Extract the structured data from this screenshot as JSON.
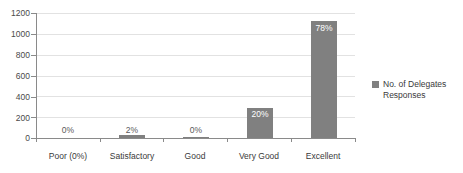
{
  "chart_data": {
    "type": "bar",
    "title": "",
    "xlabel": "",
    "ylabel": "",
    "ylim": [
      0,
      1200
    ],
    "ytick_step": 200,
    "yticks": [
      1200,
      1000,
      800,
      600,
      400,
      200,
      0
    ],
    "ytick_labels": [
      "1200",
      "1000",
      "800",
      "600",
      "400",
      "200",
      "0"
    ],
    "grid": true,
    "grid_axis": "y",
    "legend_position": "right",
    "categories": [
      "Poor (0%)",
      "Satisfactory",
      "Good",
      "Very Good",
      "Excellent"
    ],
    "series": [
      {
        "name": "No. of Delegates Responses",
        "color": "#808080",
        "values": [
          0,
          25,
          10,
          285,
          1120
        ],
        "data_labels": [
          "0%",
          "2%",
          "0%",
          "20%",
          "78%"
        ]
      }
    ],
    "points": [
      {
        "category": "Poor (0%)",
        "value": 0,
        "label": "0%",
        "label_placement": "outside"
      },
      {
        "category": "Satisfactory",
        "value": 25,
        "label": "2%",
        "label_placement": "outside"
      },
      {
        "category": "Good",
        "value": 10,
        "label": "0%",
        "label_placement": "outside"
      },
      {
        "category": "Very Good",
        "value": 285,
        "label": "20%",
        "label_placement": "inside"
      },
      {
        "category": "Excellent",
        "value": 1120,
        "label": "78%",
        "label_placement": "inside"
      }
    ]
  },
  "legend": {
    "entries": [
      {
        "label": "No. of Delegates Responses",
        "color": "#808080"
      }
    ],
    "text": "No. of Delegates Responses"
  },
  "axis": {
    "y_labels": [
      "1200",
      "1000",
      "800",
      "600",
      "400",
      "200",
      "0"
    ],
    "x_labels": [
      "Poor (0%)",
      "Satisfactory",
      "Good",
      "Very Good",
      "Excellent"
    ]
  },
  "colors": {
    "bar": "#808080",
    "gridline": "#e2e2e2",
    "axis": "#8a8a8a",
    "text": "#3a3a3a",
    "background": "#ffffff"
  }
}
